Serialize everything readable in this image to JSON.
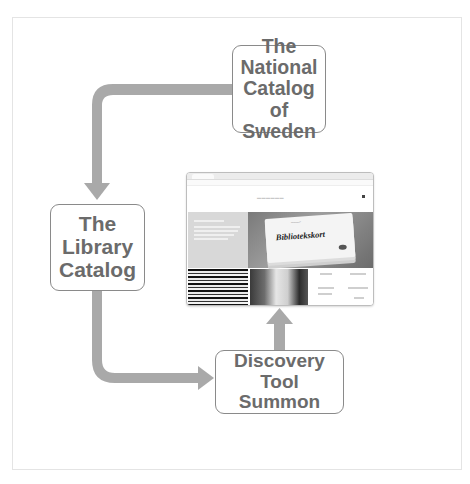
{
  "diagram": {
    "nodes": [
      {
        "id": "national",
        "label": "The\nNational\nCatalog\nof Sweden"
      },
      {
        "id": "library",
        "label": "The\nLibrary\nCatalog"
      },
      {
        "id": "summon",
        "label": "Discovery Tool\nSummon"
      }
    ],
    "edges": [
      {
        "from": "national",
        "to": "library"
      },
      {
        "from": "library",
        "to": "summon"
      },
      {
        "from": "summon",
        "to": "website-screenshot"
      }
    ],
    "colors": {
      "arrow": "#a9a9a9",
      "node_border": "#8a8a8a",
      "node_text": "#6b6b6b"
    }
  },
  "screenshot": {
    "card_title": "Bibliotekskort"
  }
}
